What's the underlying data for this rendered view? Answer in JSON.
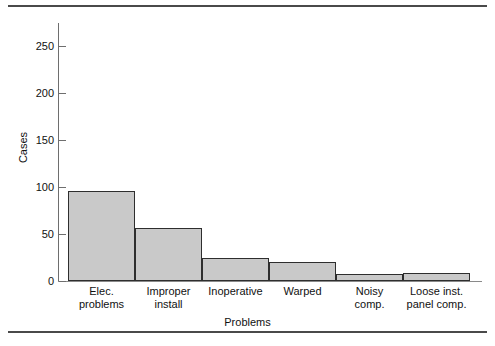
{
  "chart_data": {
    "type": "bar",
    "title": "",
    "subtitle": "",
    "xlabel": "Problems",
    "ylabel": "Cases",
    "categories": [
      "Elec. problems",
      "Improper install",
      "Inoperative",
      "Warped",
      "Noisy comp.",
      "Loose inst. panel comp."
    ],
    "category_lines": [
      [
        "Elec.",
        "problems"
      ],
      [
        "Improper",
        "install"
      ],
      [
        "Inoperative",
        ""
      ],
      [
        "Warped",
        ""
      ],
      [
        "Noisy",
        "comp."
      ],
      [
        "Loose inst.",
        "panel comp."
      ]
    ],
    "values": [
      96,
      57,
      25,
      20,
      8,
      9
    ],
    "ylim": [
      0,
      275
    ],
    "yticks": [
      0,
      50,
      100,
      150,
      200,
      250
    ],
    "ytick_labels": [
      "0",
      "50",
      "100",
      "150",
      "200",
      "250"
    ],
    "grid": false,
    "legend": null,
    "bar_fill_color": "#c9c9c9",
    "bar_edge_color": "#2e2e2e",
    "axis_color": "#6e6e6e"
  },
  "figure": {
    "rule_color": "#4a4a4a"
  }
}
